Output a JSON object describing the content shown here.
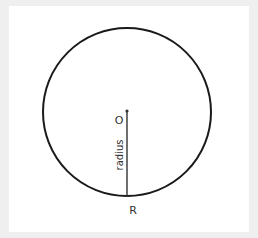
{
  "diagram": {
    "center_label": "O",
    "point_label": "R",
    "segment_label": "radius",
    "stroke_color": "#1a1a1a",
    "background": "#ffffff",
    "frame_color": "#efefef"
  }
}
